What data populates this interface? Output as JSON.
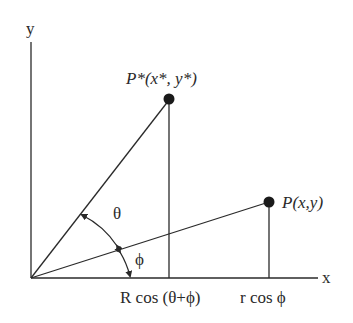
{
  "diagram": {
    "axes": {
      "x_label": "x",
      "y_label": "y"
    },
    "points": [
      {
        "id": "p_star",
        "label": "P*(x*, y*)"
      },
      {
        "id": "p",
        "label": "P(x,y)"
      }
    ],
    "angles": {
      "theta": "θ",
      "phi": "ϕ"
    },
    "projections": {
      "p_star_x": "R cos (θ+ϕ)",
      "p_x": "r cos ϕ"
    },
    "colors": {
      "line": "#2a2a2a",
      "background": "#ffffff"
    }
  }
}
